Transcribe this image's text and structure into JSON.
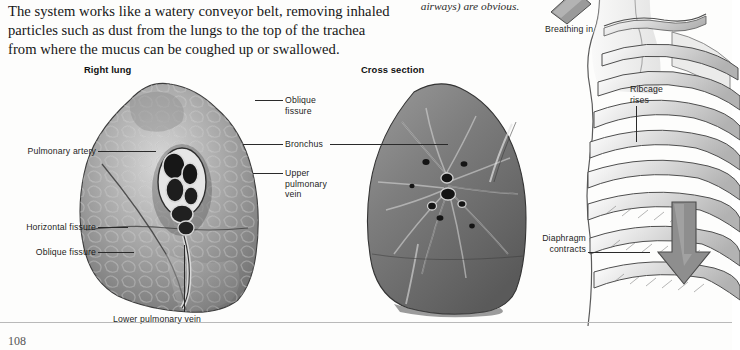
{
  "page": {
    "folio": "108",
    "background": "#fdfdfc",
    "rule_color": "#b9b9b9"
  },
  "body_text": {
    "lines": [
      "The system works like a watery conveyor belt, removing inhaled",
      "particles such as dust from the lungs to the top of the trachea",
      "from where the mucus can be coughed up or swallowed."
    ]
  },
  "caption_italic": {
    "text": "airways) are obvious."
  },
  "figures": {
    "right_lung": {
      "heading": "Right lung"
    },
    "cross_section": {
      "heading": "Cross section"
    }
  },
  "labels": {
    "pulmonary_artery": "Pulmonary artery",
    "horizontal_fissure": "Horizontal fissure",
    "oblique_fissure_left": "Oblique fissure",
    "lower_pulmonary_vein": "Lower pulmonary vein",
    "oblique_fissure_mid": "Oblique\nfissure",
    "bronchus": "Bronchus",
    "upper_pulmonary_vein": "Upper\npulmonary\nvein",
    "breathing_in": "Breathing in",
    "ribcage_rises": "Ribcage\nrises",
    "diaphragm_contracts": "Diaphragm\ncontracts"
  },
  "colors": {
    "ink": "#1d1d1d",
    "leader": "#2a2a2a",
    "lung_light": "#cfcfcf",
    "lung_mid": "#9a9a9a",
    "lung_dark": "#5e5e5e",
    "bone_light": "#f2f2f2",
    "bone_shade": "#c8c8c8",
    "arrow_fill": "#8e8e8e"
  }
}
